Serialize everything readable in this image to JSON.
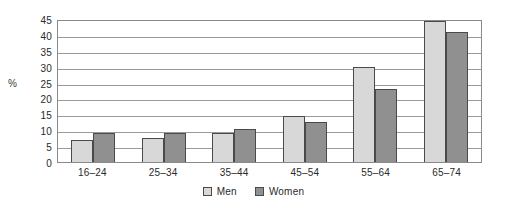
{
  "chart_data": {
    "type": "bar",
    "title": "",
    "xlabel": "",
    "ylabel": "%",
    "ylim": [
      0,
      45
    ],
    "ytick_step": 5,
    "yticks": [
      45,
      40,
      35,
      30,
      25,
      20,
      15,
      10,
      5,
      0
    ],
    "grid": true,
    "legend_position": "bottom-center",
    "categories": [
      "16–24",
      "25–34",
      "35–44",
      "45–54",
      "55–64",
      "65–74"
    ],
    "series": [
      {
        "name": "Men",
        "color": "#d8d8d8",
        "values": [
          7,
          7.5,
          9,
          14.5,
          30,
          44.5
        ]
      },
      {
        "name": "Women",
        "color": "#909090",
        "values": [
          9,
          9,
          10.5,
          12.5,
          23,
          41
        ]
      }
    ]
  },
  "legend": {
    "items": [
      {
        "label": "Men"
      },
      {
        "label": "Women"
      }
    ]
  },
  "colors": {
    "men_fill": "#d8d8d8",
    "women_fill": "#909090",
    "bar_outline": "#4a4a4a",
    "gridline": "#9a9a9a",
    "axis": "#8a8a8a",
    "text": "#2a2a2a"
  }
}
